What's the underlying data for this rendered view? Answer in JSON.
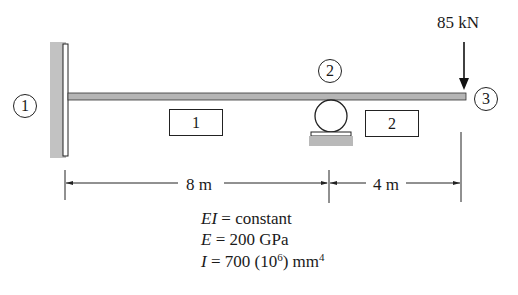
{
  "diagram": {
    "type": "beam",
    "nodes": [
      {
        "id": "1",
        "label": "1",
        "support": "fixed"
      },
      {
        "id": "2",
        "label": "2",
        "support": "roller"
      },
      {
        "id": "3",
        "label": "3",
        "support": "free"
      }
    ],
    "elements": [
      {
        "id": "1",
        "label": "1",
        "from": "1",
        "to": "2"
      },
      {
        "id": "2",
        "label": "2",
        "from": "2",
        "to": "3"
      }
    ],
    "load": {
      "value": "85 kN",
      "at_node": "3",
      "direction": "down"
    },
    "dimensions": [
      {
        "label": "8 m",
        "from": "1",
        "to": "2"
      },
      {
        "label": "4 m",
        "from": "2",
        "to": "3"
      }
    ],
    "properties": {
      "ei_var": "EI",
      "ei_rest": " = constant",
      "e_var": "E",
      "e_rest": " = 200 GPa",
      "i_var": "I",
      "i_rest": " = 700 (10",
      "i_exp": "6",
      "i_unit": ") mm",
      "i_unit_exp": "4"
    },
    "colors": {
      "beam_fill": "#b5b5b5",
      "wall_hatch": "#c2c2c2",
      "ground_fill": "#b9b9b9",
      "line": "#1a1a1a"
    }
  }
}
